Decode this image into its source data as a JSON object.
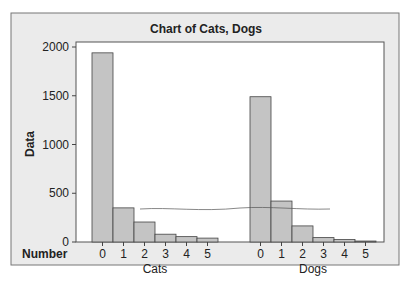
{
  "chart_data": {
    "type": "bar",
    "title": "Chart of Cats, Dogs",
    "ylabel": "Data",
    "xlabel_row": "Number",
    "ylim": [
      0,
      2000
    ],
    "yticks": [
      0,
      500,
      1000,
      1500,
      2000
    ],
    "groups": [
      {
        "name": "Cats",
        "categories": [
          "0",
          "1",
          "2",
          "3",
          "4",
          "5"
        ],
        "values": [
          1940,
          350,
          205,
          80,
          55,
          40
        ]
      },
      {
        "name": "Dogs",
        "categories": [
          "0",
          "1",
          "2",
          "3",
          "4",
          "5"
        ],
        "values": [
          1490,
          420,
          165,
          45,
          25,
          10
        ]
      }
    ],
    "grid": false
  },
  "colors": {
    "bar_fill": "#c4c4c4",
    "bar_edge": "#444444",
    "panel_bg": "#ebebeb",
    "plot_bg": "#ffffff"
  }
}
